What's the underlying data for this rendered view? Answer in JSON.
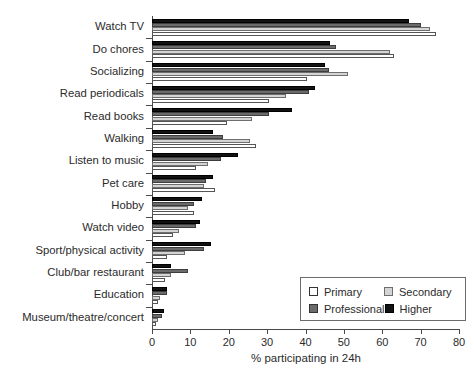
{
  "chart_data": {
    "type": "bar",
    "orientation": "horizontal",
    "title": "",
    "xlabel": "% participating in 24h",
    "ylabel": "",
    "xlim": [
      0,
      80
    ],
    "xticks": [
      0,
      10,
      20,
      30,
      40,
      50,
      60,
      70,
      80
    ],
    "grid": false,
    "legend_position": "bottom-right",
    "categories": [
      "Watch TV",
      "Do chores",
      "Socializing",
      "Read periodicals",
      "Read books",
      "Walking",
      "Listen to music",
      "Pet care",
      "Hobby",
      "Watch video",
      "Sport/physical activity",
      "Club/bar restaurant",
      "Education",
      "Museum/theatre/concert"
    ],
    "series": [
      {
        "name": "Primary",
        "color": "#ffffff",
        "values": [
          74.0,
          63.0,
          40.5,
          30.5,
          19.5,
          27.0,
          11.5,
          16.5,
          11.0,
          5.5,
          4.0,
          3.5,
          1.5,
          1.0
        ]
      },
      {
        "name": "Secondary",
        "color": "#d4d4d4",
        "values": [
          72.5,
          62.0,
          51.0,
          35.0,
          26.0,
          25.5,
          14.5,
          13.5,
          9.5,
          7.0,
          8.5,
          5.0,
          2.0,
          1.5
        ]
      },
      {
        "name": "Professional",
        "color": "#6b6b6b",
        "values": [
          70.0,
          48.0,
          46.0,
          41.0,
          30.5,
          18.5,
          18.0,
          14.0,
          11.0,
          11.5,
          13.5,
          9.5,
          4.0,
          2.5
        ]
      },
      {
        "name": "Higher",
        "color": "#121212",
        "values": [
          67.0,
          46.5,
          45.0,
          42.5,
          36.5,
          16.0,
          22.5,
          16.0,
          13.0,
          12.5,
          15.5,
          5.0,
          4.0,
          3.0
        ]
      }
    ]
  },
  "legend": {
    "entries": [
      {
        "label": "Primary",
        "key": "primary"
      },
      {
        "label": "Secondary",
        "key": "secondary"
      },
      {
        "label": "Professional",
        "key": "professional"
      },
      {
        "label": "Higher",
        "key": "higher"
      }
    ]
  }
}
